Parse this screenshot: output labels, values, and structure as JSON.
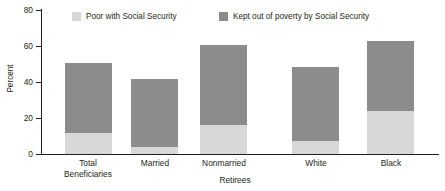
{
  "chart_data": {
    "type": "bar",
    "subtype": "stacked-vertical",
    "title": "",
    "xlabel": "Retirees",
    "ylabel": "Percent",
    "ylim": [
      0,
      80
    ],
    "yticks": [
      0,
      20,
      40,
      60,
      80
    ],
    "grid": false,
    "legend_position": "top",
    "categories": [
      "Total Beneficiaries",
      "Married",
      "Nonmarried",
      "White",
      "Black"
    ],
    "category_lines": [
      [
        "Total",
        "Beneficiaries"
      ],
      [
        "Married",
        ""
      ],
      [
        "Nonmarried",
        ""
      ],
      [
        "White",
        ""
      ],
      [
        "Black",
        ""
      ]
    ],
    "series": [
      {
        "name": "Poor with Social Security",
        "color": "#d8d8d8",
        "values": [
          11.5,
          4,
          16,
          7,
          24
        ]
      },
      {
        "name": "Kept out of poverty by Social Security",
        "color": "#8c8c8c",
        "values": [
          39,
          37.5,
          44.5,
          41.5,
          39
        ]
      }
    ],
    "totals": [
      50.5,
      41.5,
      60.5,
      48.5,
      63
    ]
  },
  "legend": {
    "items": [
      {
        "label": "Poor with Social Security",
        "color": "#d8d8d8"
      },
      {
        "label": "Kept out of poverty by Social Security",
        "color": "#8c8c8c"
      }
    ]
  },
  "axes": {
    "y_title": "Percent",
    "x_title": "Retirees",
    "y_ticks": [
      "80",
      "60",
      "40",
      "20",
      "0"
    ]
  },
  "colors": {
    "poor": "#d8d8d8",
    "kept": "#8c8c8c",
    "axis": "#231f20",
    "background": "#ffffff"
  }
}
